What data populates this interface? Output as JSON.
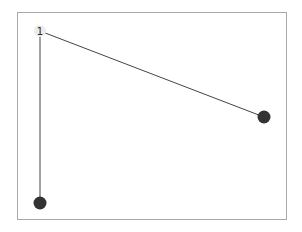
{
  "graph": {
    "nodes": [
      {
        "id": "n1",
        "label": "1",
        "x": 40,
        "y": 31,
        "style": "light"
      },
      {
        "id": "n2",
        "label": "",
        "x": 264,
        "y": 117,
        "style": "dark"
      },
      {
        "id": "n3",
        "label": "",
        "x": 40,
        "y": 203,
        "style": "dark"
      }
    ],
    "edges": [
      {
        "from": "n1",
        "to": "n2"
      },
      {
        "from": "n1",
        "to": "n3"
      }
    ]
  },
  "colors": {
    "edge": "#444444",
    "dark_node": "#333333",
    "light_node": "#ececec",
    "frame": "#a8a8a8"
  }
}
